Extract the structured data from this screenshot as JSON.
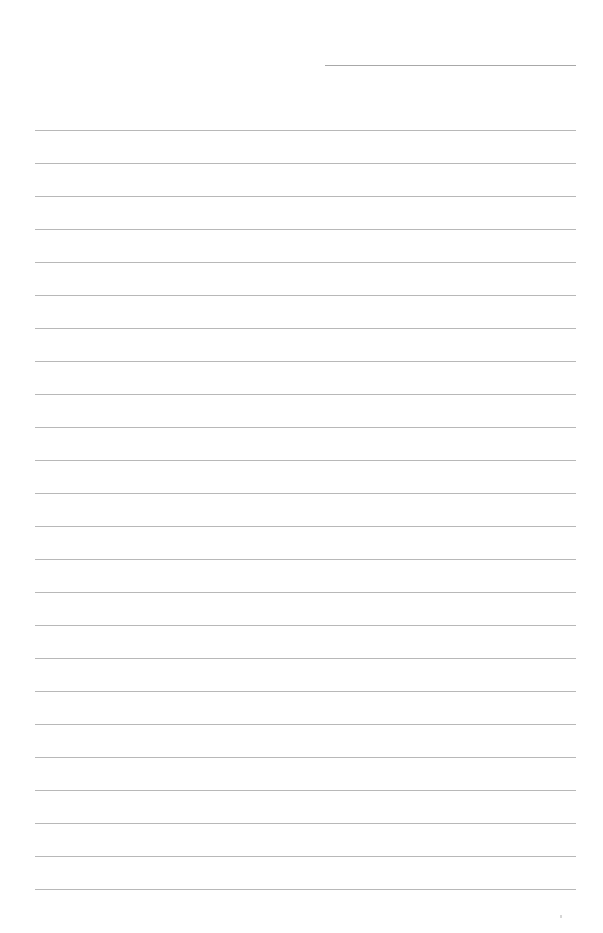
{
  "page": {
    "type": "lined-paper",
    "background_color": "#ffffff",
    "line_color": "#b8b8b8"
  },
  "header_line": {
    "x_start": 325,
    "x_end": 576,
    "y": 65
  },
  "ruled_lines": {
    "x_start": 35,
    "x_end": 576,
    "first_y": 130,
    "spacing": 33,
    "count": 24
  },
  "footer_mark": {
    "x": 560,
    "y": 915
  }
}
